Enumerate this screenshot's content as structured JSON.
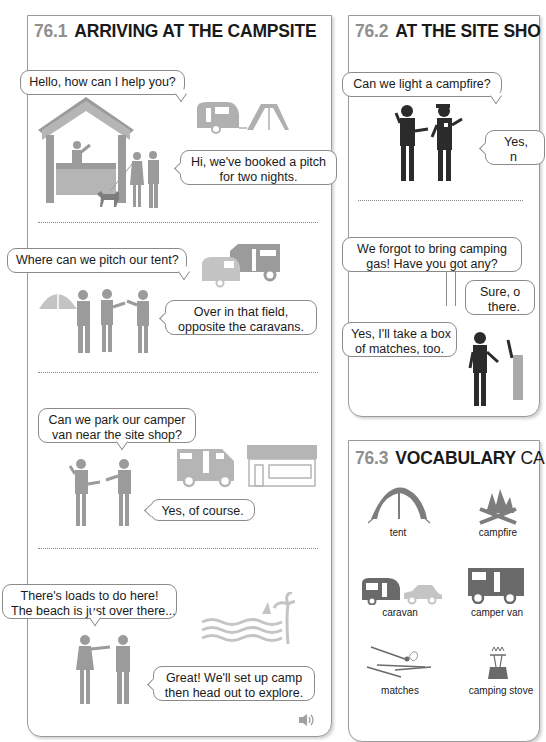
{
  "sections": {
    "arriving": {
      "number": "76.1",
      "title": "ARRIVING AT THE CAMPSITE",
      "dialogues": [
        {
          "speech": "Hello, how can I help you?",
          "reply_line1": "Hi, we've booked a pitch",
          "reply_line2": "for two nights."
        },
        {
          "speech": "Where can we pitch our tent?",
          "reply_line1": "Over in that field,",
          "reply_line2": "opposite the caravans."
        },
        {
          "speech_line1": "Can we park our camper",
          "speech_line2": "van near the site shop?",
          "reply": "Yes, of course."
        },
        {
          "speech_line1": "There's loads to do here!",
          "speech_line2": "The beach is just over there...",
          "reply_line1": "Great! We'll set up camp",
          "reply_line2": "then head out to explore."
        }
      ],
      "audio_icon": "speaker-icon"
    },
    "site_shop": {
      "number": "76.2",
      "title": "AT THE SITE SHO",
      "dialogues": [
        {
          "speech": "Can we light a campfire?",
          "reply_line1": "Yes,",
          "reply_line2": "n"
        },
        {
          "speech_line1": "We forgot to bring camping",
          "speech_line2": "gas! Have you got any?",
          "reply_line1": "Sure, o",
          "reply_line2": "there.",
          "extra_line1": "Yes, I'll take a box",
          "extra_line2": "of matches, too."
        }
      ]
    },
    "vocabulary": {
      "number": "76.3",
      "title_bold": "VOCABULARY",
      "title_rest": "CA",
      "items": [
        {
          "label": "tent",
          "icon": "tent-icon"
        },
        {
          "label": "campfire",
          "icon": "campfire-icon"
        },
        {
          "label": "caravan",
          "icon": "caravan-icon"
        },
        {
          "label": "camper van",
          "icon": "camper-van-icon"
        },
        {
          "label": "matches",
          "icon": "matches-icon"
        },
        {
          "label": "camping stove",
          "icon": "camping-stove-icon"
        }
      ]
    }
  },
  "colors": {
    "illustration_gray": "#9b9b9b",
    "illustration_light": "#c4c4c4",
    "figure_dark": "#2b2b2b",
    "section_number": "#8f8f8f"
  }
}
